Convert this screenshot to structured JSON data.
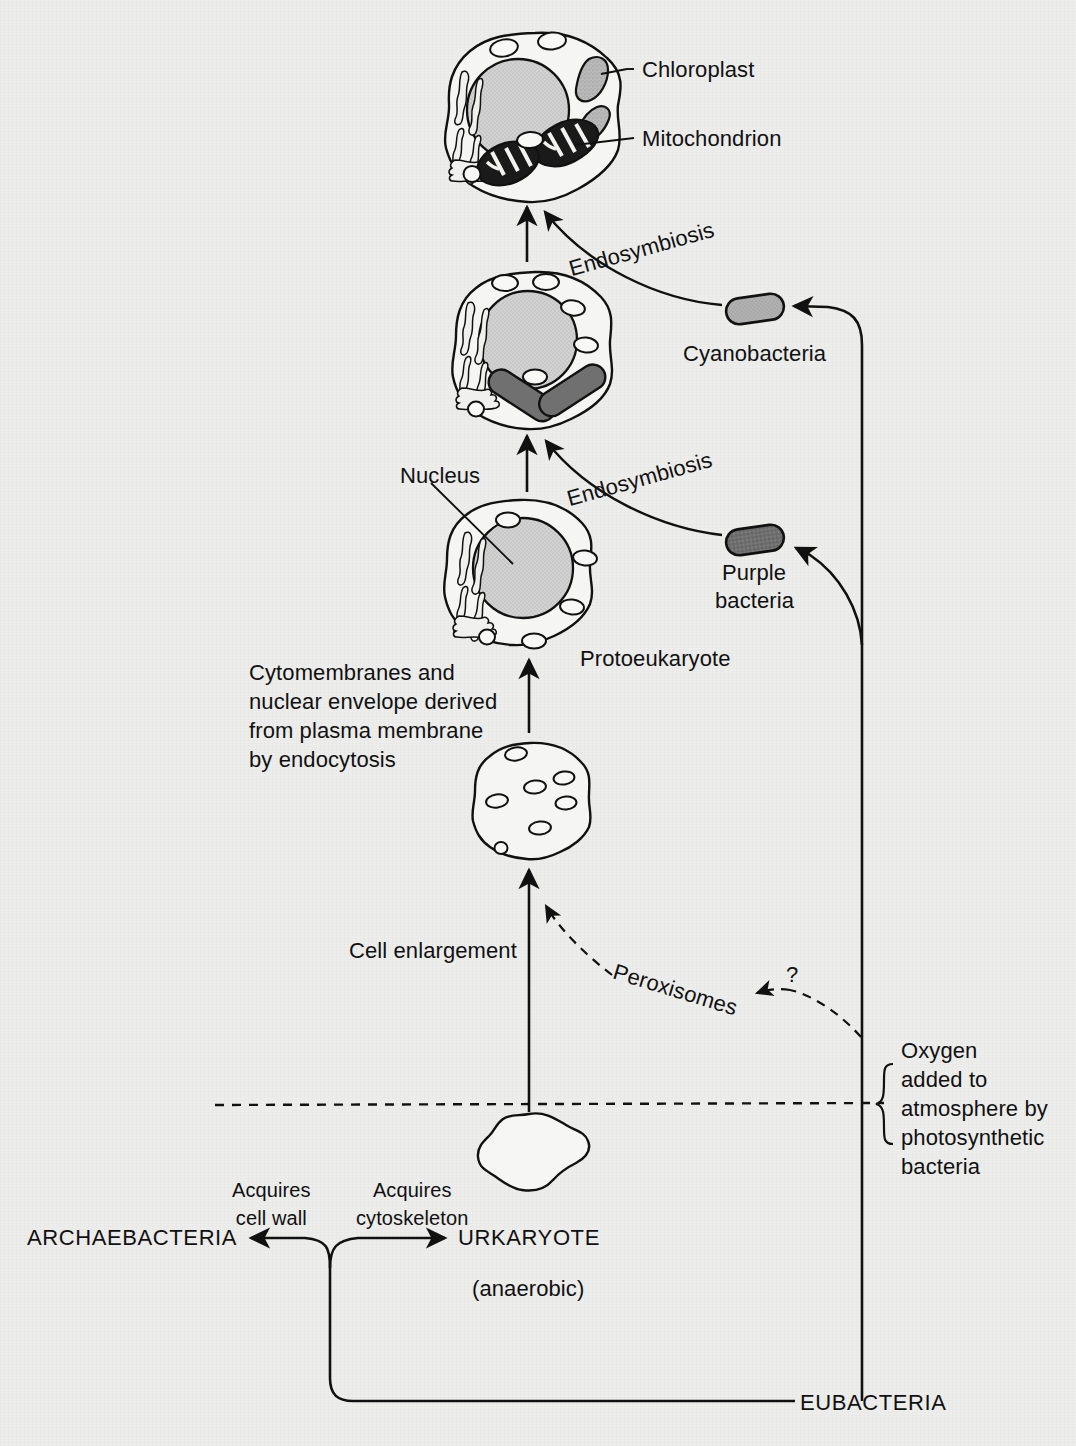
{
  "diagram": {
    "background_color": "#ededec",
    "ink_color": "#111111"
  },
  "labels": {
    "chloroplast": "Chloroplast",
    "mitochondrion": "Mitochondrion",
    "endosymbiosis_upper": "Endosymbiosis",
    "endosymbiosis_lower": "Endosymbiosis",
    "cyanobacteria": "Cyanobacteria",
    "nucleus": "Nucleus",
    "purple_bacteria_line1": "Purple",
    "purple_bacteria_line2": "bacteria",
    "protoeukaryote": "Protoeukaryote",
    "cytomembranes_note": "Cytomembranes and\nnuclear envelope derived\nfrom plasma membrane\nby endocytosis",
    "cell_enlargement": "Cell enlargement",
    "peroxisomes": "Peroxisomes",
    "question_mark": "?",
    "oxygen_note": "Oxygen\nadded to\natmosphere by\nphotosynthetic\nbacteria",
    "acquires_cell_wall": "Acquires\ncell wall",
    "acquires_cytoskeleton": "Acquires\ncytoskeleton",
    "archaebacteria": "ARCHAEBACTERIA",
    "urkaryote": "URKARYOTE",
    "anaerobic": "(anaerobic)",
    "eubacteria": "EUBACTERIA"
  },
  "organelles": {
    "nucleus_fill": "#cfcfcf",
    "chloroplast_fill": "#b9b9b9",
    "mitochondrion_fill": "#1a1a1a",
    "cyanobacteria_fill": "#b0b0b0",
    "purple_bacteria_fill": "#6d6d6d",
    "cytoplasm_fill": "#f4f4f3",
    "vesicle_fill": "#f7f7f6"
  },
  "cells": [
    {
      "name": "modern-eukaryote",
      "cx": 535,
      "cy": 118,
      "r": 85,
      "has_nucleus": true,
      "has_chloroplasts": true,
      "has_mitochondria": true
    },
    {
      "name": "proto-with-organelles",
      "cx": 535,
      "cy": 350,
      "r": 78,
      "has_nucleus": true,
      "has_chloroplasts": false,
      "has_mitochondria": true
    },
    {
      "name": "protoeukaryote",
      "cx": 520,
      "cy": 572,
      "r": 73,
      "has_nucleus": true,
      "has_chloroplasts": false,
      "has_mitochondria": false
    },
    {
      "name": "enlarged-cell",
      "cx": 530,
      "cy": 805,
      "r": 60,
      "has_nucleus": false,
      "has_chloroplasts": false,
      "has_mitochondria": false
    },
    {
      "name": "urkaryote-blob",
      "cx": 533,
      "cy": 1152,
      "r": 48,
      "has_nucleus": false,
      "has_chloroplasts": false,
      "has_mitochondria": false
    }
  ]
}
